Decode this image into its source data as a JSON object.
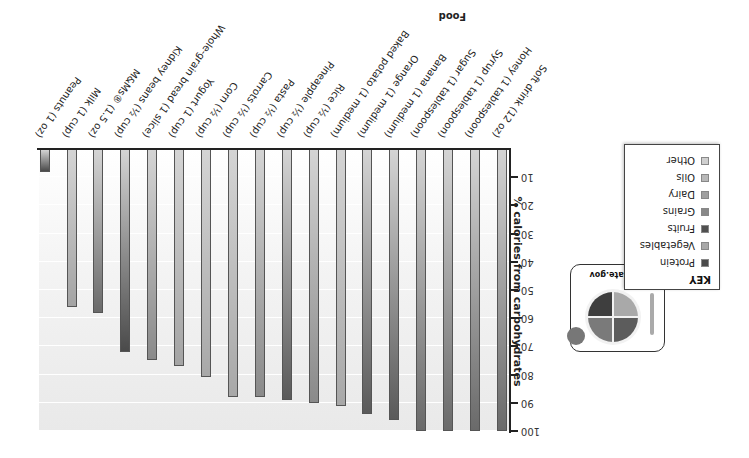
{
  "chart_data": {
    "type": "bar",
    "orientation_note": "figure displayed rotated 180 degrees",
    "title": "",
    "xlabel": "Food",
    "ylabel": "% calories from carbohydrates",
    "ylim": [
      0,
      100
    ],
    "yticks": [
      10,
      20,
      30,
      40,
      50,
      60,
      70,
      80,
      90,
      100
    ],
    "grid": true,
    "categories": [
      "Soft drink (12 oz)",
      "Honey (1 tablespoon)",
      "Syrup (1 tablespoon)",
      "Sugar (1 tablespoon)",
      "Banana (1 medium)",
      "Orange (1 medium)",
      "Baked potato (1 medium)",
      "Rice (½ cup)",
      "Pineapple (½ cup)",
      "Pasta (½ cup)",
      "Carrots (½ cup)",
      "Corn (½ cup)",
      "Yogurt (1 cup)",
      "Whole-grain bread (1 slice)",
      "Kidney beans (½ cup)",
      "M&Ms® (1.5 oz)",
      "Milk (1 cup)",
      "Peanuts (1 oz)"
    ],
    "values": [
      100,
      100,
      100,
      100,
      96,
      94,
      91,
      90,
      89,
      88,
      88,
      81,
      77,
      75,
      72,
      58,
      56,
      8
    ],
    "groups": [
      "Other",
      "Other",
      "Other",
      "Other",
      "Fruits",
      "Fruits",
      "Vegetables",
      "Grains",
      "Fruits",
      "Grains",
      "Vegetables",
      "Vegetables",
      "Dairy",
      "Grains",
      "Protein",
      "Other",
      "Dairy",
      "Protein"
    ],
    "legend": {
      "title": "KEY",
      "position": "upper-left (upright)",
      "entries": [
        "Protein",
        "Vegetables",
        "Fruits",
        "Grains",
        "Dairy",
        "Oils",
        "Other"
      ]
    }
  },
  "axis": {
    "ticks": [
      "10",
      "20",
      "30",
      "40",
      "50",
      "60",
      "70",
      "80",
      "90",
      "100"
    ],
    "y_title": "% calories from carbohydrates",
    "x_title": "Food"
  },
  "legend": {
    "title": "KEY",
    "items": [
      {
        "label": "Protein",
        "color": "#4a4a4a"
      },
      {
        "label": "Vegetables",
        "color": "#a8a8a8"
      },
      {
        "label": "Fruits",
        "color": "#505050"
      },
      {
        "label": "Grains",
        "color": "#888888"
      },
      {
        "label": "Dairy",
        "color": "#a0a0a0"
      },
      {
        "label": "Oils",
        "color": "#b8b8b8"
      },
      {
        "label": "Other",
        "color": "#cfcfcf"
      }
    ]
  },
  "myplate": {
    "title": "MyPlate.gov"
  },
  "group_colors": {
    "Protein": "#4a4a4a",
    "Vegetables": "#a8a8a8",
    "Fruits": "#5a5a5a",
    "Grains": "#8a8a8a",
    "Dairy": "#a4a4a4",
    "Oils": "#b8b8b8",
    "Other": "#6a6a6a"
  }
}
